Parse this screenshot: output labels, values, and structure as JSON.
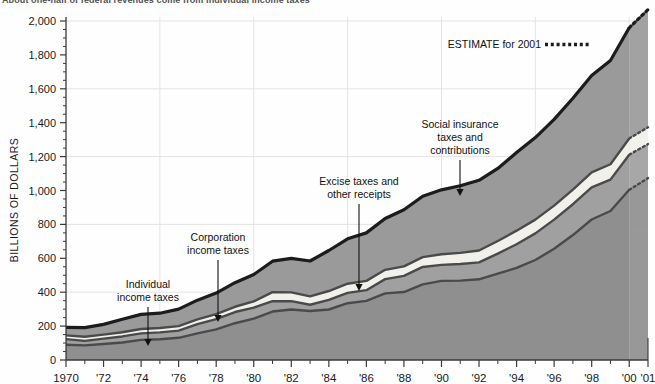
{
  "headline": "About one-half of federal revenues come from individual income taxes",
  "axis": {
    "ylabel": "BILLIONS OF DOLLARS",
    "yticks": [
      "0",
      "200",
      "400",
      "600",
      "800",
      "1,000",
      "1,200",
      "1,400",
      "1,600",
      "1,800",
      "2,000"
    ],
    "xticks": [
      "1970",
      "'72",
      "'74",
      "'76",
      "'78",
      "'80",
      "'82",
      "'84",
      "'86",
      "'88",
      "'90",
      "'92",
      "'94",
      "'96",
      "'98",
      "'00",
      "'01"
    ]
  },
  "legend": {
    "estimate_label": "ESTIMATE for 2001",
    "estimate_marker": "dotted-line"
  },
  "annotations": [
    {
      "name": "individual-income-taxes",
      "lines": [
        "Individual",
        "income taxes"
      ],
      "x": 148,
      "y": 288,
      "arrow_to_y": 346
    },
    {
      "name": "corporation-income-taxes",
      "lines": [
        "Corporation",
        "income taxes"
      ],
      "x": 218,
      "y": 241,
      "arrow_to_y": 322
    },
    {
      "name": "excise-taxes-and-other-receipts",
      "lines": [
        "Excise taxes and",
        "other receipts"
      ],
      "x": 359,
      "y": 185,
      "arrow_to_y": 291
    },
    {
      "name": "social-insurance-taxes-and-contributions",
      "lines": [
        "Social insurance",
        "taxes and",
        "contributions"
      ],
      "x": 460,
      "y": 128,
      "arrow_to_y": 196
    }
  ],
  "colors": {
    "individual": "#8f8f8f",
    "social_insurance": "#9a9a9a",
    "excise": "#f2f0ea",
    "corporation": "#a0a0a0",
    "outline_dark": "#1c1c1c",
    "outline_mid": "#4a4a4a",
    "grid": "#e3e3e3",
    "axis": "#3a3a3a"
  },
  "chart_data": {
    "type": "area",
    "title": "About one-half of federal revenues come from individual income taxes",
    "xlabel": "",
    "ylabel": "BILLIONS OF DOLLARS",
    "ylim": [
      0,
      2100
    ],
    "xlim": [
      1970,
      2001
    ],
    "grid": true,
    "stacked": true,
    "legend": "ESTIMATE for 2001 (dotted)",
    "estimate_year": 2001,
    "x": [
      1970,
      1971,
      1972,
      1973,
      1974,
      1975,
      1976,
      1977,
      1978,
      1979,
      1980,
      1981,
      1982,
      1983,
      1984,
      1985,
      1986,
      1987,
      1988,
      1989,
      1990,
      1991,
      1992,
      1993,
      1994,
      1995,
      1996,
      1997,
      1998,
      1999,
      2000,
      2001
    ],
    "series": [
      {
        "name": "Individual income taxes",
        "color": "#8f8f8f",
        "values": [
          90,
          86,
          94,
          103,
          119,
          122,
          131,
          157,
          181,
          217,
          244,
          286,
          298,
          289,
          298,
          335,
          349,
          393,
          401,
          446,
          467,
          468,
          476,
          510,
          543,
          590,
          656,
          737,
          829,
          879,
          1004,
          1073
        ]
      },
      {
        "name": "Corporation income taxes",
        "color": "#a0a0a0",
        "values": [
          33,
          27,
          32,
          36,
          38,
          41,
          42,
          55,
          60,
          66,
          65,
          61,
          49,
          37,
          57,
          61,
          63,
          84,
          95,
          103,
          94,
          98,
          100,
          118,
          140,
          157,
          172,
          182,
          189,
          185,
          207,
          201
        ]
      },
      {
        "name": "Excise taxes and other receipts",
        "color": "#f2f0ea",
        "values": [
          22,
          24,
          24,
          25,
          26,
          26,
          27,
          28,
          30,
          31,
          37,
          53,
          52,
          49,
          52,
          54,
          55,
          55,
          56,
          58,
          63,
          66,
          70,
          74,
          80,
          81,
          83,
          86,
          89,
          91,
          96,
          99
        ]
      },
      {
        "name": "Social insurance taxes and contributions",
        "color": "#9a9a9a",
        "values": [
          48,
          54,
          60,
          76,
          86,
          87,
          100,
          113,
          124,
          142,
          158,
          183,
          201,
          209,
          239,
          265,
          283,
          303,
          334,
          359,
          380,
          396,
          414,
          428,
          461,
          484,
          509,
          539,
          572,
          612,
          653,
          694
        ]
      }
    ],
    "totals": [
      193,
      191,
      210,
      240,
      269,
      276,
      300,
      353,
      395,
      456,
      504,
      583,
      600,
      584,
      646,
      715,
      750,
      835,
      886,
      966,
      1004,
      1028,
      1060,
      1130,
      1224,
      1312,
      1420,
      1544,
      1679,
      1767,
      1960,
      2067
    ]
  }
}
